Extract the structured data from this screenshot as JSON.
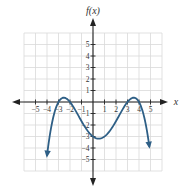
{
  "chart_data": {
    "type": "line",
    "title": "",
    "xlabel": "x",
    "ylabel": "f(x)",
    "xlim": [
      -6,
      6
    ],
    "ylim": [
      -6,
      6
    ],
    "grid": true,
    "x_ticks": [
      -5,
      -4,
      -3,
      -2,
      -1,
      1,
      2,
      3,
      4,
      5
    ],
    "y_ticks": [
      -5,
      -4,
      -3,
      -2,
      -1,
      1,
      2,
      3,
      4,
      5
    ],
    "series": [
      {
        "name": "f(x)",
        "color": "#2e5f86",
        "end_arrows": true,
        "function": "-(1/24)(x+3)(x+2)(x-3)(x-4)",
        "x": [
          -4.0,
          -3.5,
          -3.0,
          -2.5,
          -2.0,
          -1.5,
          -1.0,
          -0.5,
          0.0,
          0.5,
          1.0,
          1.5,
          2.0,
          2.5,
          3.0,
          3.5,
          4.0,
          4.5,
          4.9
        ],
        "y": [
          -4.67,
          -1.61,
          0.0,
          0.37,
          0.0,
          -0.86,
          -1.0,
          -2.41,
          -3.0,
          -3.16,
          -3.0,
          -2.58,
          -2.0,
          -1.41,
          0.0,
          0.37,
          0.0,
          -1.72,
          -3.89
        ],
        "key_points": {
          "local_max_left": [
            -2.5,
            0.4
          ],
          "local_min": [
            0.4,
            -3.2
          ],
          "local_max_right": [
            3.5,
            0.4
          ],
          "y_intercept": [
            0,
            -3
          ],
          "x_intercepts": [
            -3,
            -2,
            3,
            4
          ]
        }
      }
    ]
  },
  "labels": {
    "y_axis": "f(x)",
    "x_axis": "x"
  },
  "colors": {
    "curve": "#2e5f86",
    "grid": "#d9d9d9",
    "axis": "#222222"
  }
}
